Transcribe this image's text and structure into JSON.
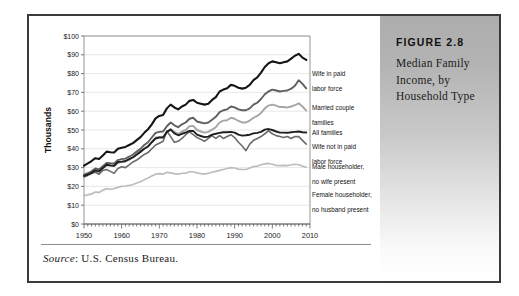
{
  "figure": {
    "number_label": "FIGURE 2.8",
    "title": "Median Family Income, by Household Type"
  },
  "source": {
    "prefix": "Source",
    "separator": ": ",
    "text": "U.S. Census Bureau."
  },
  "chart_data": {
    "type": "line",
    "title": "Median Family Income, by Household Type",
    "xlabel": "",
    "ylabel": "Thousands",
    "xlim": [
      1950,
      2010
    ],
    "ylim": [
      0,
      100
    ],
    "grid": true,
    "legend_position": "right-of-plot",
    "x_ticks": [
      1950,
      1960,
      1970,
      1980,
      1990,
      2000,
      2010
    ],
    "x_tick_labels": [
      "1950",
      "1960",
      "1970",
      "1980",
      "1990",
      "2000",
      "2010"
    ],
    "y_ticks": [
      0,
      10,
      20,
      30,
      40,
      50,
      60,
      70,
      80,
      90,
      100
    ],
    "y_tick_labels": [
      "$0",
      "$10",
      "$20",
      "$30",
      "$40",
      "$50",
      "$60",
      "$70",
      "$80",
      "$90",
      "$100"
    ],
    "x": [
      1950,
      1951,
      1952,
      1953,
      1954,
      1955,
      1956,
      1957,
      1958,
      1959,
      1960,
      1961,
      1962,
      1963,
      1964,
      1965,
      1966,
      1967,
      1968,
      1969,
      1970,
      1971,
      1972,
      1973,
      1974,
      1975,
      1976,
      1977,
      1978,
      1979,
      1980,
      1981,
      1982,
      1983,
      1984,
      1985,
      1986,
      1987,
      1988,
      1989,
      1990,
      1991,
      1992,
      1993,
      1994,
      1995,
      1996,
      1997,
      1998,
      1999,
      2000,
      2001,
      2002,
      2003,
      2004,
      2005,
      2006,
      2007,
      2008,
      2009
    ],
    "series": [
      {
        "name": "Wife in paid labor force",
        "color": "#151515",
        "width": 2.1,
        "label_lines": [
          "Wife in paid",
          "labor force"
        ],
        "values": [
          31.0,
          32.2,
          33.5,
          35.0,
          34.6,
          36.4,
          38.5,
          38.2,
          38.0,
          40.0,
          40.6,
          41.0,
          42.0,
          43.0,
          44.6,
          46.2,
          48.5,
          50.4,
          53.0,
          56.2,
          57.5,
          58.0,
          61.5,
          63.5,
          62.0,
          61.0,
          62.5,
          63.5,
          65.5,
          66.0,
          64.5,
          64.0,
          63.5,
          64.0,
          66.0,
          67.5,
          70.5,
          71.5,
          72.2,
          74.0,
          73.5,
          72.5,
          72.0,
          72.5,
          74.0,
          76.5,
          78.0,
          80.5,
          83.5,
          85.5,
          86.5,
          86.0,
          85.5,
          86.0,
          86.5,
          88.0,
          89.5,
          90.5,
          88.5,
          87.3
        ]
      },
      {
        "name": "Married couple families",
        "color": "#5f5f5f",
        "width": 1.9,
        "label_lines": [
          "Married couple",
          "families"
        ],
        "values": [
          26.2,
          27.0,
          28.0,
          29.5,
          29.0,
          30.8,
          32.5,
          32.3,
          32.2,
          34.0,
          34.5,
          34.8,
          35.8,
          37.0,
          38.5,
          40.0,
          42.0,
          43.5,
          46.0,
          48.5,
          49.0,
          49.2,
          52.0,
          54.0,
          52.5,
          51.5,
          53.0,
          54.0,
          56.0,
          56.5,
          54.5,
          54.0,
          53.5,
          54.0,
          55.5,
          57.0,
          59.5,
          60.5,
          61.0,
          62.5,
          62.0,
          61.0,
          60.5,
          60.5,
          61.5,
          63.5,
          64.5,
          66.5,
          69.0,
          70.5,
          71.5,
          71.0,
          70.5,
          70.8,
          71.0,
          72.0,
          73.5,
          76.5,
          74.5,
          72.2
        ]
      },
      {
        "name": "All families",
        "color": "#a6a6a6",
        "width": 1.9,
        "label_lines": [
          "All families"
        ],
        "values": [
          25.0,
          25.8,
          26.8,
          28.2,
          27.8,
          29.5,
          31.2,
          31.0,
          30.8,
          32.6,
          33.0,
          33.2,
          34.2,
          35.4,
          36.8,
          38.2,
          40.0,
          41.4,
          43.6,
          46.0,
          46.2,
          46.2,
          48.8,
          50.6,
          49.0,
          48.0,
          49.2,
          50.0,
          52.0,
          52.2,
          50.0,
          49.2,
          48.6,
          49.0,
          50.2,
          51.5,
          54.0,
          55.0,
          55.2,
          56.5,
          56.0,
          54.8,
          54.0,
          54.0,
          55.0,
          56.5,
          57.5,
          59.0,
          61.5,
          63.0,
          63.5,
          63.0,
          62.2,
          62.2,
          62.0,
          62.5,
          63.2,
          64.2,
          62.5,
          60.3
        ]
      },
      {
        "name": "Wife not in paid labor force",
        "color": "#1f1f1f",
        "width": 1.9,
        "label_lines": [
          "Wife not in paid",
          "labor force"
        ],
        "values": [
          25.5,
          26.2,
          27.2,
          28.5,
          28.0,
          29.8,
          31.5,
          31.2,
          31.0,
          33.0,
          33.2,
          33.5,
          34.5,
          35.5,
          37.0,
          38.5,
          40.0,
          41.2,
          43.5,
          45.5,
          46.0,
          46.0,
          49.0,
          50.2,
          48.2,
          47.2,
          48.0,
          48.6,
          49.5,
          49.5,
          47.5,
          46.8,
          46.2,
          46.5,
          47.5,
          48.0,
          48.5,
          48.8,
          48.8,
          49.0,
          48.6,
          47.5,
          47.0,
          47.2,
          47.5,
          48.2,
          48.5,
          49.0,
          50.2,
          50.5,
          50.0,
          49.2,
          48.6,
          48.6,
          48.5,
          48.8,
          49.0,
          49.2,
          48.8,
          48.7
        ]
      },
      {
        "name": "Male householder, no wife present",
        "color": "#6b6b6b",
        "width": 1.6,
        "label_lines": [
          "Male householder,",
          "no wife present"
        ],
        "values": [
          25.8,
          26.5,
          27.0,
          27.5,
          26.5,
          28.5,
          29.0,
          28.0,
          27.0,
          29.5,
          30.5,
          30.0,
          31.5,
          33.0,
          34.0,
          35.5,
          37.0,
          38.0,
          40.0,
          42.0,
          43.0,
          44.0,
          49.5,
          46.5,
          43.5,
          44.0,
          45.5,
          47.5,
          49.0,
          47.5,
          46.0,
          45.0,
          44.0,
          45.5,
          47.0,
          45.5,
          47.0,
          45.5,
          46.5,
          47.5,
          46.0,
          43.5,
          41.5,
          39.0,
          42.5,
          44.5,
          45.5,
          46.5,
          48.0,
          49.5,
          48.0,
          47.0,
          46.5,
          46.0,
          46.5,
          45.5,
          46.5,
          46.5,
          44.5,
          42.5
        ]
      },
      {
        "name": "Female householder, no husband present",
        "color": "#bdbdbd",
        "width": 1.7,
        "label_lines": [
          "Female householder,",
          "no husband present"
        ],
        "values": [
          15.0,
          15.5,
          16.0,
          17.0,
          16.8,
          18.0,
          18.8,
          18.5,
          18.8,
          19.5,
          20.0,
          20.2,
          20.5,
          21.0,
          21.8,
          22.5,
          23.5,
          24.5,
          25.5,
          26.5,
          26.8,
          26.5,
          27.5,
          27.2,
          26.8,
          26.5,
          27.0,
          27.0,
          27.8,
          27.8,
          27.2,
          26.8,
          26.5,
          27.0,
          27.5,
          28.0,
          28.5,
          29.0,
          29.5,
          30.0,
          29.8,
          29.2,
          29.0,
          29.0,
          29.8,
          30.5,
          30.8,
          31.5,
          32.0,
          32.2,
          31.8,
          31.2,
          31.0,
          31.2,
          31.0,
          31.5,
          31.8,
          31.5,
          30.8,
          30.2
        ]
      }
    ]
  }
}
